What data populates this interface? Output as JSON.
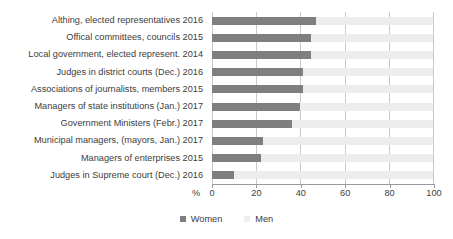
{
  "chart_data": {
    "type": "bar",
    "orientation": "horizontal",
    "stacked": true,
    "title": "",
    "subtitle": "",
    "xlabel": "%",
    "ylabel": "",
    "xlim": [
      0,
      100
    ],
    "xticks": [
      0,
      20,
      40,
      60,
      80,
      100
    ],
    "xticklabels": [
      "0",
      "20",
      "40",
      "60",
      "80",
      "100"
    ],
    "grid": true,
    "grid_axis": "x",
    "legend": [
      "Women",
      "Men"
    ],
    "legend_position": "bottom-center",
    "colors": {
      "women": "#7f7f7f",
      "men": "#ededed",
      "gridline": "#c9c9c9",
      "axis": "#9a9a9a",
      "text": "#3d3d3d"
    },
    "categories": [
      "Althing, elected representatives 2016",
      "Offical committees, councils 2015",
      "Local government, elected represent. 2014",
      "Judges in district courts (Dec.) 2016",
      "Associations of journalists, members 2015",
      "Managers of state institutions (Jan.) 2017",
      "Government Ministers (Febr.) 2017",
      "Municipal managers, (mayors, Jan.) 2017",
      "Managers of enterprises 2015",
      "Judges in Supreme court (Dec.) 2016"
    ],
    "series": [
      {
        "name": "Women",
        "values": [
          47,
          45,
          45,
          41,
          41,
          40,
          36,
          23,
          22,
          10
        ]
      },
      {
        "name": "Men",
        "values": [
          53,
          55,
          55,
          59,
          59,
          60,
          64,
          77,
          78,
          90
        ]
      }
    ]
  }
}
